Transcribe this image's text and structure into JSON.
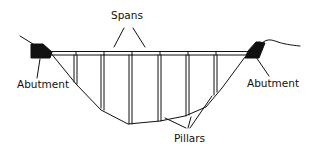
{
  "diagram": {
    "type": "beam bridge cross-section",
    "labels": {
      "spans": "Spans",
      "abutment_left": "Abutment",
      "abutment_right": "Abutment",
      "pillars": "Pillars"
    },
    "components": {
      "deck": "horizontal double-line deck across valley",
      "pillar_count": 6,
      "abutment_count": 2
    },
    "colors": {
      "line": "#111111",
      "background": "#ffffff"
    }
  }
}
